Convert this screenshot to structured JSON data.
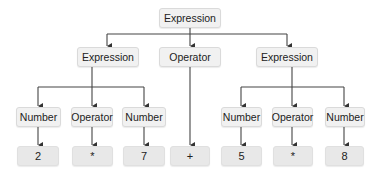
{
  "diagram": {
    "type": "parse-tree",
    "colors": {
      "node_fill": "#f1f1f1",
      "leaf_fill": "#e8e8e8",
      "border": "#dadada",
      "edge": "#333333"
    },
    "root": {
      "label": "Expression"
    },
    "level1": [
      {
        "label": "Expression"
      },
      {
        "label": "Operator"
      },
      {
        "label": "Expression"
      }
    ],
    "level2": [
      {
        "label": "Number"
      },
      {
        "label": "Operator"
      },
      {
        "label": "Number"
      },
      {
        "label": "Number"
      },
      {
        "label": "Operator"
      },
      {
        "label": "Number"
      }
    ],
    "leaves": [
      {
        "label": "2"
      },
      {
        "label": "*"
      },
      {
        "label": "7"
      },
      {
        "label": "+"
      },
      {
        "label": "5"
      },
      {
        "label": "*"
      },
      {
        "label": "8"
      }
    ]
  }
}
